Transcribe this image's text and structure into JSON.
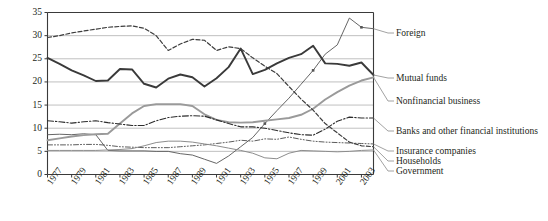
{
  "chart_data": {
    "type": "line",
    "title": "",
    "xlabel": "",
    "ylabel": "",
    "grid": true,
    "legend_position": "right-inline",
    "xlim": [
      1977,
      2004
    ],
    "ylim": [
      0,
      35
    ],
    "yticks": [
      "0",
      "5",
      "10",
      "15",
      "20",
      "25",
      "30",
      "35"
    ],
    "ytick_values": [
      0,
      5,
      10,
      15,
      20,
      25,
      30,
      35
    ],
    "xticks": [
      "1977",
      "1979",
      "1981",
      "1983",
      "1985",
      "1987",
      "1989",
      "1991",
      "1993",
      "1995",
      "1997",
      "1999",
      "2001",
      "2003"
    ],
    "xtick_values": [
      1977,
      1979,
      1981,
      1983,
      1985,
      1987,
      1989,
      1991,
      1993,
      1995,
      1997,
      1999,
      2001,
      2003
    ],
    "x": [
      1977,
      1978,
      1979,
      1980,
      1981,
      1982,
      1983,
      1984,
      1985,
      1986,
      1987,
      1988,
      1989,
      1990,
      1991,
      1992,
      1993,
      1994,
      1995,
      1996,
      1997,
      1998,
      1999,
      2000,
      2001,
      2002,
      2003,
      2004
    ],
    "series": [
      {
        "name": "Foreign",
        "style": "solid-thin-marked",
        "color": "#555555",
        "values": [
          8.6,
          8.7,
          8.6,
          8.8,
          8.6,
          5.2,
          5.1,
          5.1,
          5.1,
          5.0,
          5.0,
          4.5,
          4.2,
          3.3,
          2.4,
          4.0,
          6.0,
          8.0,
          11.0,
          13.8,
          16.5,
          19.5,
          22.5,
          26.0,
          28.0,
          33.8,
          31.8,
          31.5
        ]
      },
      {
        "name": "Mutual funds",
        "style": "solid-thick",
        "color": "#3a3a3a",
        "values": [
          25.2,
          23.9,
          22.5,
          21.4,
          20.2,
          20.3,
          22.8,
          22.7,
          19.6,
          18.8,
          20.7,
          21.6,
          21.0,
          19.0,
          20.8,
          23.2,
          27.2,
          21.7,
          22.6,
          24.0,
          25.2,
          26.0,
          27.8,
          24.0,
          23.9,
          23.5,
          24.2,
          21.5
        ]
      },
      {
        "name": "Nonfinancial business",
        "style": "solid-gray",
        "color": "#9a9a9a",
        "values": [
          7.4,
          7.8,
          8.2,
          8.5,
          8.7,
          8.8,
          11.0,
          13.2,
          14.8,
          15.2,
          15.2,
          15.2,
          14.8,
          13.0,
          11.8,
          11.3,
          11.2,
          11.3,
          11.6,
          11.9,
          12.2,
          12.9,
          14.2,
          16.2,
          17.8,
          19.2,
          20.3,
          21.0
        ]
      },
      {
        "name": "Banks and other financial institutions",
        "style": "dash-dot",
        "color": "#2c2c2c",
        "values": [
          11.6,
          11.4,
          11.1,
          11.4,
          11.6,
          11.2,
          10.9,
          10.6,
          10.6,
          11.6,
          12.3,
          12.6,
          12.7,
          12.6,
          11.8,
          11.0,
          10.3,
          10.3,
          10.0,
          9.5,
          9.0,
          8.6,
          8.5,
          9.8,
          11.5,
          12.4,
          12.2,
          12.2
        ]
      },
      {
        "name": "Insurance companies",
        "style": "dash-dot-dot",
        "color": "#4a4a4a",
        "values": [
          6.4,
          6.4,
          6.4,
          6.5,
          6.5,
          6.3,
          6.0,
          5.9,
          5.8,
          5.8,
          5.8,
          6.0,
          6.2,
          6.4,
          6.7,
          7.0,
          7.4,
          7.2,
          7.7,
          7.6,
          8.1,
          7.6,
          7.2,
          7.0,
          6.9,
          6.8,
          6.7,
          6.6
        ]
      },
      {
        "name": "Households",
        "style": "dashed-fine",
        "color": "#3d3d3d",
        "values": [
          29.6,
          30.0,
          30.6,
          31.0,
          31.4,
          31.8,
          32.0,
          32.1,
          31.6,
          30.0,
          26.8,
          28.2,
          29.2,
          29.0,
          26.8,
          27.6,
          27.2,
          25.2,
          23.4,
          21.8,
          19.0,
          16.3,
          13.9,
          11.0,
          9.0,
          7.0,
          6.2,
          6.0
        ]
      },
      {
        "name": "Government",
        "style": "solid-gray-thin",
        "color": "#8d8d8d",
        "values": [
          5.2,
          5.2,
          5.2,
          5.2,
          5.2,
          5.3,
          5.4,
          5.6,
          6.2,
          6.9,
          7.2,
          7.2,
          7.0,
          6.6,
          6.2,
          5.7,
          5.2,
          4.6,
          3.6,
          3.4,
          4.6,
          5.2,
          5.1,
          5.0,
          4.9,
          5.0,
          5.2,
          5.3
        ]
      }
    ]
  },
  "legend": {
    "items": [
      {
        "label": "Foreign"
      },
      {
        "label": "Mutual funds"
      },
      {
        "label": "Nonfinancial business"
      },
      {
        "label": "Banks and other financial institutions"
      },
      {
        "label": "Insurance companies"
      },
      {
        "label": "Households"
      },
      {
        "label": "Government"
      }
    ]
  }
}
